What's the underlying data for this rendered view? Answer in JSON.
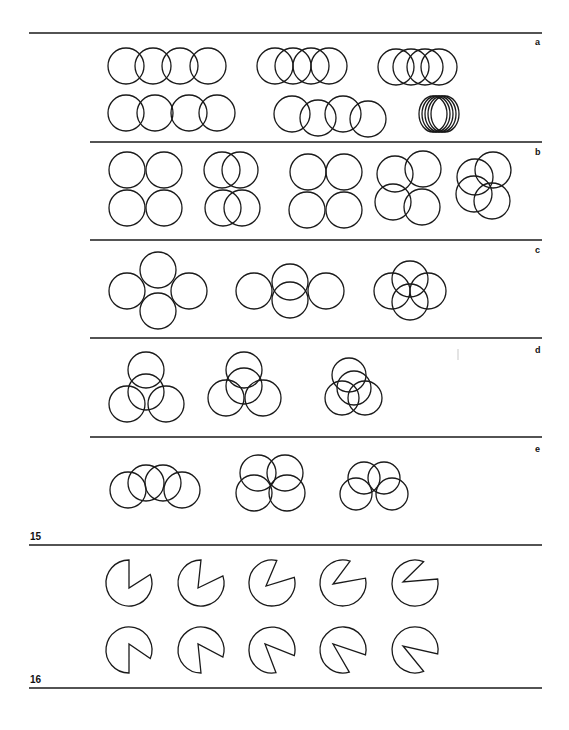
{
  "figure15": {
    "number": "15",
    "panels": [
      {
        "label": "a",
        "rule_y": 33,
        "label_pos": [
          535,
          45
        ],
        "r": 18,
        "groups": [
          {
            "name": "row1-spaced",
            "circles": [
              [
                126,
                66
              ],
              [
                153,
                66
              ],
              [
                180,
                66
              ],
              [
                208,
                66
              ]
            ]
          },
          {
            "name": "row1-overlap",
            "circles": [
              [
                275,
                66
              ],
              [
                293,
                66
              ],
              [
                311,
                66
              ],
              [
                329,
                66
              ]
            ]
          },
          {
            "name": "row1-tight",
            "circles": [
              [
                396,
                67
              ],
              [
                411,
                67
              ],
              [
                425,
                67
              ],
              [
                439,
                67
              ]
            ]
          },
          {
            "name": "row2-spaced",
            "circles": [
              [
                126,
                113
              ],
              [
                155,
                113
              ],
              [
                189,
                113
              ],
              [
                217,
                113
              ]
            ]
          },
          {
            "name": "row2-staggered",
            "circles": [
              [
                292,
                114
              ],
              [
                318,
                118
              ],
              [
                343,
                114
              ],
              [
                368,
                119
              ]
            ]
          },
          {
            "name": "row2-stacked",
            "circles": [
              [
                433,
                114
              ],
              [
                436,
                114
              ],
              [
                439,
                114
              ],
              [
                442,
                114
              ],
              [
                445,
                114
              ]
            ],
            "rx": 14
          }
        ]
      },
      {
        "label": "b",
        "rule_y": 142,
        "label_pos": [
          535,
          155
        ],
        "r": 18,
        "groups": [
          {
            "name": "grid-touching",
            "circles": [
              [
                127,
                170
              ],
              [
                164,
                170
              ],
              [
                127,
                208
              ],
              [
                164,
                208
              ]
            ]
          },
          {
            "name": "grid-shifted",
            "circles": [
              [
                222,
                170
              ],
              [
                240,
                170
              ],
              [
                223,
                208
              ],
              [
                242,
                208
              ]
            ]
          },
          {
            "name": "grid-diamond",
            "circles": [
              [
                308,
                172
              ],
              [
                344,
                172
              ],
              [
                307,
                210
              ],
              [
                344,
                210
              ]
            ]
          },
          {
            "name": "grid-offset",
            "circles": [
              [
                395,
                174
              ],
              [
                423,
                169
              ],
              [
                393,
                202
              ],
              [
                422,
                207
              ]
            ]
          },
          {
            "name": "grid-central",
            "circles": [
              [
                475,
                177
              ],
              [
                493,
                170
              ],
              [
                474,
                194
              ],
              [
                492,
                201
              ]
            ]
          }
        ]
      },
      {
        "label": "c",
        "rule_y": 240,
        "label_pos": [
          535,
          253
        ],
        "r": 18,
        "groups": [
          {
            "name": "cross-spaced",
            "circles": [
              [
                158,
                270
              ],
              [
                127,
                291
              ],
              [
                189,
                291
              ],
              [
                158,
                311
              ]
            ]
          },
          {
            "name": "cross-middle",
            "circles": [
              [
                254,
                291
              ],
              [
                290,
                282
              ],
              [
                290,
                300
              ],
              [
                326,
                291
              ]
            ]
          },
          {
            "name": "cross-tight",
            "circles": [
              [
                392,
                291
              ],
              [
                410,
                279
              ],
              [
                410,
                302
              ],
              [
                428,
                291
              ]
            ]
          }
        ]
      },
      {
        "label": "d",
        "rule_y": 338,
        "label_pos": [
          535,
          353
        ],
        "r": 18,
        "groups": [
          {
            "name": "trefoil-loose",
            "circles": [
              [
                146,
                370
              ],
              [
                146,
                392
              ],
              [
                127,
                404
              ],
              [
                166,
                404
              ]
            ]
          },
          {
            "name": "trefoil-mid",
            "circles": [
              [
                244,
                370
              ],
              [
                244,
                386
              ],
              [
                226,
                398
              ],
              [
                263,
                398
              ]
            ]
          },
          {
            "name": "trefoil-tight",
            "circles": [
              [
                349,
                375
              ],
              [
                354,
                388
              ],
              [
                342,
                398
              ],
              [
                365,
                398
              ]
            ],
            "r": 17
          }
        ]
      },
      {
        "label": "e",
        "rule_y": 437,
        "label_pos": [
          535,
          452
        ],
        "r": 18,
        "groups": [
          {
            "name": "chain-overlap",
            "circles": [
              [
                128,
                490
              ],
              [
                146,
                483
              ],
              [
                163,
                483
              ],
              [
                182,
                490
              ]
            ]
          },
          {
            "name": "flower-four",
            "circles": [
              [
                258,
                473
              ],
              [
                285,
                473
              ],
              [
                254,
                493
              ],
              [
                287,
                493
              ]
            ]
          },
          {
            "name": "flower-tight",
            "circles": [
              [
                364,
                478
              ],
              [
                384,
                478
              ],
              [
                356,
                494
              ],
              [
                392,
                494
              ]
            ],
            "r": 16
          }
        ]
      }
    ],
    "bottom_rule_y": 545,
    "number_pos": [
      30,
      540
    ]
  },
  "figure16": {
    "number": "16",
    "number_pos": [
      30,
      683
    ],
    "bottom_rule_y": 688,
    "r": 23,
    "rows": [
      {
        "name": "mouth-top-right",
        "items": [
          {
            "cx": 129,
            "cy": 583,
            "vx": 129,
            "vy": 588,
            "a1": -90,
            "a2": -22
          },
          {
            "cx": 201,
            "cy": 583,
            "vx": 198,
            "vy": 588,
            "a1": -90,
            "a2": -18
          },
          {
            "cx": 272,
            "cy": 583,
            "vx": 266,
            "vy": 586,
            "a1": -78,
            "a2": -14
          },
          {
            "cx": 343,
            "cy": 583,
            "vx": 333,
            "vy": 584,
            "a1": -72,
            "a2": -12
          },
          {
            "cx": 415,
            "cy": 583,
            "vx": 403,
            "vy": 582,
            "a1": -68,
            "a2": -10
          }
        ]
      },
      {
        "name": "mouth-bottom-right",
        "items": [
          {
            "cx": 129,
            "cy": 650,
            "vx": 129,
            "vy": 644,
            "a1": 22,
            "a2": 90
          },
          {
            "cx": 201,
            "cy": 650,
            "vx": 198,
            "vy": 644,
            "a1": 18,
            "a2": 90
          },
          {
            "cx": 272,
            "cy": 650,
            "vx": 265,
            "vy": 644,
            "a1": 14,
            "a2": 80
          },
          {
            "cx": 343,
            "cy": 650,
            "vx": 333,
            "vy": 644,
            "a1": 12,
            "a2": 74
          },
          {
            "cx": 415,
            "cy": 650,
            "vx": 403,
            "vy": 646,
            "a1": 10,
            "a2": 68
          }
        ]
      }
    ]
  },
  "rules": {
    "left": 90,
    "left_full": 29,
    "right": 542
  },
  "stray_mark": {
    "x": 458,
    "y1": 349,
    "y2": 360
  }
}
